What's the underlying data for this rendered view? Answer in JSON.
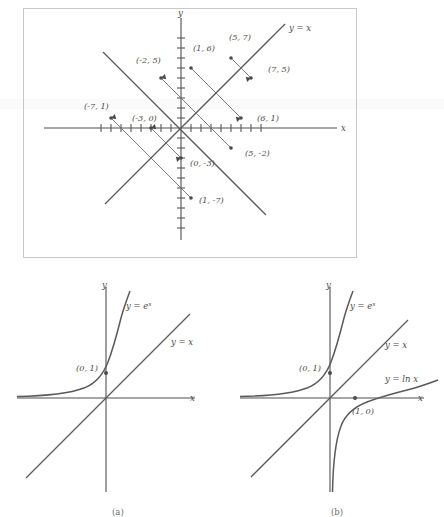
{
  "figure": {
    "kind": "math-graph-figure",
    "ink_color": "#4a4a4a",
    "line_color": "#5a5a5a",
    "frame_color": "#c8c8c8"
  },
  "top_panel": {
    "name": "reflection-across-identity-line",
    "axis_x_label": "x",
    "axis_y_label": "y",
    "identity_line_label": "y = x",
    "x_tick_count_each_side": 8,
    "y_tick_count_each_side": 8,
    "tick_spacing_px": 10,
    "point_pairs": [
      {
        "from": {
          "label": "(1, 6)",
          "x": 1,
          "y": 6
        },
        "to": {
          "label": "(6, 1)",
          "x": 6,
          "y": 1
        }
      },
      {
        "from": {
          "label": "(5, 7)",
          "x": 5,
          "y": 7
        },
        "to": {
          "label": "(7, 5)",
          "x": 7,
          "y": 5
        }
      },
      {
        "from": {
          "label": "(-2, 5)",
          "x": -2,
          "y": 5
        },
        "to": {
          "label": "(5, -2)",
          "x": 5,
          "y": -2
        }
      },
      {
        "from": {
          "label": "(-7, 1)",
          "x": -7,
          "y": 1
        },
        "to": {
          "label": "(1, -7)",
          "x": 1,
          "y": -7
        }
      },
      {
        "from": {
          "label": "(-3, 0)",
          "x": -3,
          "y": 0
        },
        "to": {
          "label": "(0, -3)",
          "x": 0,
          "y": -3
        }
      }
    ],
    "labels": [
      "(1, 6)",
      "(5, 7)",
      "(-2, 5)",
      "(-7, 1)",
      "(-3, 0)",
      "(6, 1)",
      "(7, 5)",
      "(5, -2)",
      "(1, -7)",
      "(0, -3)"
    ]
  },
  "panel_a": {
    "name": "exponential-and-identity",
    "caption": "(a)",
    "axis_x_label": "x",
    "axis_y_label": "y",
    "curves": [
      {
        "label": "y = e^x",
        "display": "y = e",
        "exponent": "x",
        "type": "exponential"
      },
      {
        "label": "y = x",
        "display": "y = x",
        "type": "line"
      }
    ],
    "marked_points": [
      {
        "label": "(0, 1)",
        "x": 0,
        "y": 1
      }
    ]
  },
  "panel_b": {
    "name": "exponential-identity-and-logarithm",
    "caption": "(b)",
    "axis_x_label": "x",
    "axis_y_label": "y",
    "curves": [
      {
        "label": "y = e^x",
        "display": "y = e",
        "exponent": "x",
        "type": "exponential"
      },
      {
        "label": "y = x",
        "display": "y = x",
        "type": "line"
      },
      {
        "label": "y = ln x",
        "display": "y = ln x",
        "type": "logarithm"
      }
    ],
    "marked_points": [
      {
        "label": "(0, 1)",
        "x": 0,
        "y": 1
      },
      {
        "label": "(1, 0)",
        "x": 1,
        "y": 0
      }
    ]
  }
}
